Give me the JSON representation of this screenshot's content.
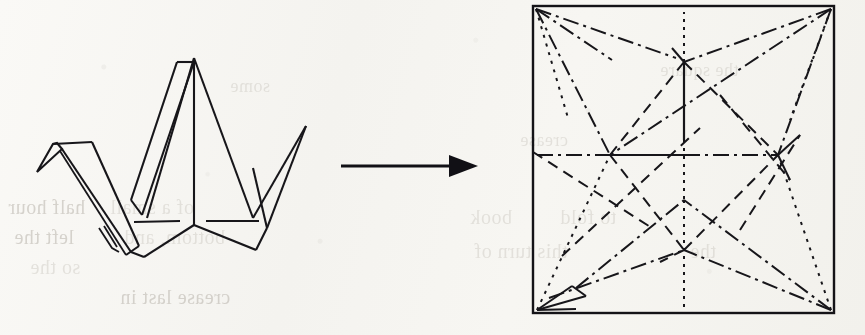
{
  "figure": {
    "caption": "",
    "background_color": "#f6f5f1",
    "ink_color": "#17161a"
  },
  "ghost_text": {
    "note": "faint bleed-through text from reverse side of scanned page",
    "lines": [
      {
        "text": "half hour",
        "x": 8,
        "y": 196,
        "size": 20,
        "faint": false
      },
      {
        "text": "of a small",
        "x": 110,
        "y": 196,
        "size": 20,
        "faint": true
      },
      {
        "text": "left the",
        "x": 14,
        "y": 226,
        "size": 20,
        "faint": false
      },
      {
        "text": "bottom, and",
        "x": 124,
        "y": 226,
        "size": 20,
        "faint": true
      },
      {
        "text": "so the",
        "x": 30,
        "y": 256,
        "size": 20,
        "faint": true
      },
      {
        "text": "crease last in",
        "x": 120,
        "y": 286,
        "size": 20,
        "faint": false
      },
      {
        "text": "book",
        "x": 470,
        "y": 206,
        "size": 20,
        "faint": true
      },
      {
        "text": "to fold",
        "x": 560,
        "y": 206,
        "size": 20,
        "faint": true
      },
      {
        "text": "this turn of",
        "x": 474,
        "y": 240,
        "size": 20,
        "faint": true
      },
      {
        "text": "the",
        "x": 690,
        "y": 240,
        "size": 20,
        "faint": true
      },
      {
        "text": "crease",
        "x": 520,
        "y": 130,
        "size": 18,
        "faint": true
      },
      {
        "text": "some",
        "x": 230,
        "y": 76,
        "size": 18,
        "faint": true
      },
      {
        "text": "the square",
        "x": 660,
        "y": 60,
        "size": 18,
        "faint": true
      }
    ]
  },
  "crane": {
    "label": "origami-crane",
    "position": {
      "x": 30,
      "y": 40,
      "width": 300,
      "height": 215
    }
  },
  "arrow": {
    "label": "transformation-arrow",
    "direction": "right",
    "shaft": {
      "x1": 341,
      "y1": 166,
      "x2": 460,
      "y2": 166
    },
    "head": {
      "tip_x": 478,
      "tip_y": 166,
      "back_x": 451,
      "half_height": 11
    }
  },
  "crease_pattern": {
    "label": "crease-pattern-square",
    "square": {
      "x": 533,
      "y": 6,
      "width": 301,
      "height": 307
    },
    "line_styles": {
      "mountain": "dash-dot",
      "valley": "dashed",
      "edge": "solid"
    }
  }
}
